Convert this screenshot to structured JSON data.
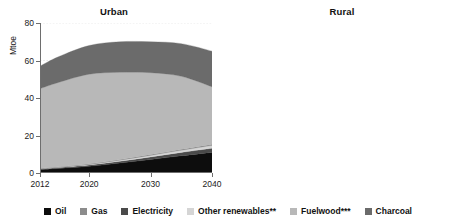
{
  "legend": {
    "items": [
      {
        "label": "Oil",
        "color": "#0d0d0d",
        "name": "legend-item-oil"
      },
      {
        "label": "Gas",
        "color": "#8c8c8c",
        "name": "legend-item-gas"
      },
      {
        "label": "Electricity",
        "color": "#4a4a4a",
        "name": "legend-item-electricity"
      },
      {
        "label": "Other renewables**",
        "color": "#d5d5d5",
        "name": "legend-item-other-renewables"
      },
      {
        "label": "Fuelwood***",
        "color": "#b8b8b8",
        "name": "legend-item-fuelwood"
      },
      {
        "label": "Charcoal",
        "color": "#6b6b6b",
        "name": "legend-item-charcoal"
      }
    ]
  },
  "chart_data": [
    {
      "type": "area",
      "title": "Urban",
      "xlabel": "",
      "ylabel": "Mtoe",
      "stacked": true,
      "grid": true,
      "legend_position": "bottom",
      "xlim": [
        2012,
        2040
      ],
      "ylim": [
        0,
        80
      ],
      "yticks": [
        0,
        20,
        40,
        60,
        80
      ],
      "xticks": [
        2012,
        2020,
        2030,
        2040
      ],
      "x": [
        2012,
        2015,
        2020,
        2025,
        2030,
        2035,
        2040
      ],
      "series": [
        {
          "name": "Oil",
          "color": "#0d0d0d",
          "values": [
            1.8,
            2.4,
            3.6,
            5.3,
            7.2,
            9.2,
            11.0
          ]
        },
        {
          "name": "Electricity",
          "color": "#4a4a4a",
          "values": [
            0.4,
            0.5,
            0.7,
            1.0,
            1.4,
            1.8,
            2.2
          ]
        },
        {
          "name": "Other renewables**",
          "color": "#d5d5d5",
          "values": [
            0.1,
            0.2,
            0.3,
            0.5,
            0.8,
            1.1,
            1.5
          ]
        },
        {
          "name": "Gas",
          "color": "#8c8c8c",
          "values": [
            0.2,
            0.2,
            0.3,
            0.4,
            0.5,
            0.6,
            0.7
          ]
        },
        {
          "name": "Fuelwood***",
          "color": "#b8b8b8",
          "values": [
            42.5,
            45.0,
            47.8,
            46.5,
            43.6,
            38.9,
            30.6
          ]
        },
        {
          "name": "Charcoal",
          "color": "#6b6b6b",
          "values": [
            12.0,
            13.7,
            15.3,
            16.3,
            16.5,
            17.4,
            19.0
          ]
        }
      ],
      "totals": [
        57.0,
        62.0,
        68.0,
        70.0,
        70.0,
        69.0,
        65.0
      ]
    },
    {
      "type": "area",
      "title": "Rural",
      "xlabel": "",
      "ylabel": "Mtoe",
      "stacked": true,
      "grid": true,
      "legend_position": "bottom",
      "xlim": [
        2012,
        2040
      ],
      "ylim": [
        0,
        250
      ],
      "yticks": [
        0,
        50,
        100,
        150,
        200,
        250
      ],
      "xticks": [
        2012,
        2020,
        2030,
        2040
      ],
      "x": [
        2012,
        2015,
        2020,
        2025,
        2030,
        2035,
        2040
      ],
      "series": [
        {
          "name": "Oil",
          "color": "#0d0d0d",
          "values": [
            0.6,
            0.8,
            1.2,
            1.6,
            2.0,
            2.5,
            3.0
          ]
        },
        {
          "name": "Electricity",
          "color": "#4a4a4a",
          "values": [
            0.3,
            0.4,
            0.6,
            0.9,
            1.2,
            1.5,
            1.8
          ]
        },
        {
          "name": "Other renewables**",
          "color": "#d5d5d5",
          "values": [
            0.1,
            0.2,
            0.3,
            0.5,
            0.7,
            0.9,
            1.2
          ]
        },
        {
          "name": "Gas",
          "color": "#8c8c8c",
          "values": [
            0.1,
            0.1,
            0.2,
            0.2,
            0.3,
            0.3,
            0.4
          ]
        },
        {
          "name": "Fuelwood***",
          "color": "#b8b8b8",
          "values": [
            156.9,
            168.5,
            182.7,
            190.8,
            191.8,
            188.8,
            180.6
          ]
        },
        {
          "name": "Charcoal",
          "color": "#6b6b6b",
          "values": [
            4.0,
            5.0,
            6.0,
            8.0,
            10.0,
            12.0,
            13.0
          ]
        }
      ],
      "totals": [
        162.0,
        175.0,
        191.0,
        202.0,
        206.0,
        206.0,
        200.0
      ]
    }
  ]
}
